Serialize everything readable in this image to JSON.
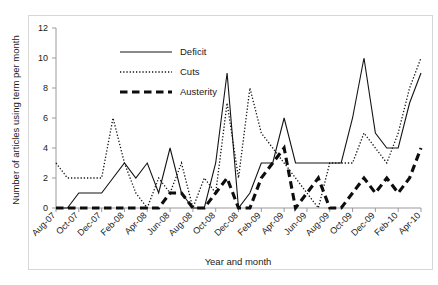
{
  "figure": {
    "background_color": "#ffffff",
    "axis_color": "#9a9a9a",
    "ink_color": "#141414"
  },
  "chart_data": {
    "type": "line",
    "title": "",
    "xlabel": "Year and month",
    "ylabel": "Number of articles using term per month",
    "ylim": [
      0,
      12
    ],
    "yticks": [
      0,
      2,
      4,
      6,
      8,
      10,
      12
    ],
    "grid": false,
    "legend_position": "top-left-inside",
    "x": [
      "Aug-07",
      "Sep-07",
      "Oct-07",
      "Nov-07",
      "Dec-07",
      "Jan-08",
      "Feb-08",
      "Mar-08",
      "Apr-08",
      "May-08",
      "Jun-08",
      "Jul-08",
      "Aug-08",
      "Sep-08",
      "Oct-08",
      "Nov-08",
      "Dec-08",
      "Jan-09",
      "Feb-09",
      "Mar-09",
      "Apr-09",
      "May-09",
      "Jun-09",
      "Jul-09",
      "Aug-09",
      "Sep-09",
      "Oct-09",
      "Nov-09",
      "Dec-09",
      "Jan-10",
      "Feb-10",
      "Mar-10",
      "Apr-10"
    ],
    "xticklabels": [
      "Aug-07",
      "Oct-07",
      "Dec-07",
      "Feb-08",
      "Apr-08",
      "Jun-08",
      "Aug-08",
      "Oct-08",
      "Dec-08",
      "Feb-09",
      "Apr-09",
      "Jun-09",
      "Aug-09",
      "Oct-09",
      "Dec-09",
      "Feb-10",
      "Apr-10"
    ],
    "xtick_indices": [
      0,
      2,
      4,
      6,
      8,
      10,
      12,
      14,
      16,
      18,
      20,
      22,
      24,
      26,
      28,
      30,
      32
    ],
    "series": [
      {
        "name": "Deficit",
        "style": "solid",
        "values": [
          0,
          0,
          1,
          1,
          1,
          2,
          3,
          2,
          3,
          1,
          4,
          1,
          0,
          0,
          3,
          9,
          0,
          1,
          3,
          3,
          6,
          3,
          3,
          3,
          3,
          3,
          6,
          10,
          5,
          4,
          4,
          7,
          9
        ]
      },
      {
        "name": "Cuts",
        "style": "dotted",
        "values": [
          3,
          2,
          2,
          2,
          2,
          6,
          3,
          1,
          0,
          2,
          1,
          3,
          0,
          2,
          1,
          7,
          2,
          8,
          5,
          4,
          3,
          2,
          1,
          0,
          3,
          3,
          3,
          5,
          4,
          3,
          5,
          8,
          10
        ]
      },
      {
        "name": "Austerity",
        "style": "thick-dashed",
        "values": [
          0,
          0,
          0,
          0,
          0,
          0,
          0,
          0,
          0,
          0,
          1,
          1,
          0,
          0,
          1,
          2,
          0,
          0,
          2,
          3,
          4,
          0,
          1,
          2,
          0,
          0,
          1,
          2,
          1,
          2,
          1,
          2,
          4
        ]
      }
    ]
  },
  "legend": {
    "items": [
      {
        "label": "Deficit",
        "style": "solid"
      },
      {
        "label": "Cuts",
        "style": "dotted"
      },
      {
        "label": "Austerity",
        "style": "thick-dashed"
      }
    ]
  }
}
